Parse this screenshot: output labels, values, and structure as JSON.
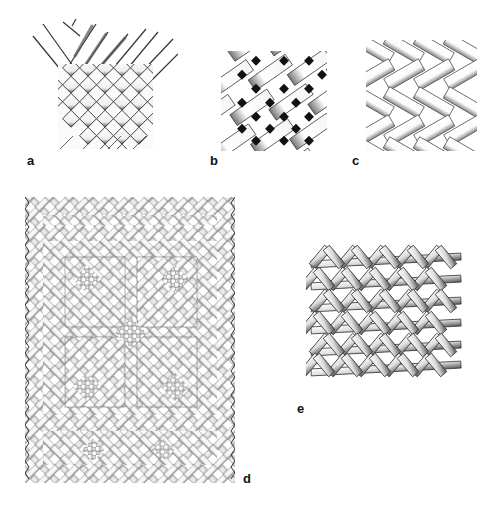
{
  "figure": {
    "panels": [
      {
        "id": "a",
        "label": "a",
        "pattern": "plain-weave-diagonal-with-loose-elements-at-top"
      },
      {
        "id": "b",
        "label": "b",
        "pattern": "diagonal-plain-weave-dark-gaps"
      },
      {
        "id": "c",
        "label": "c",
        "pattern": "herringbone-twill"
      },
      {
        "id": "d",
        "label": "d",
        "pattern": "patterned-twill-with-border-and-diamond-motifs"
      },
      {
        "id": "e",
        "label": "e",
        "pattern": "open-hexagonal-weave"
      }
    ]
  },
  "colors": {
    "background": "#ffffff",
    "ink": "#111111",
    "shade": "#888888",
    "light": "#dddddd"
  }
}
